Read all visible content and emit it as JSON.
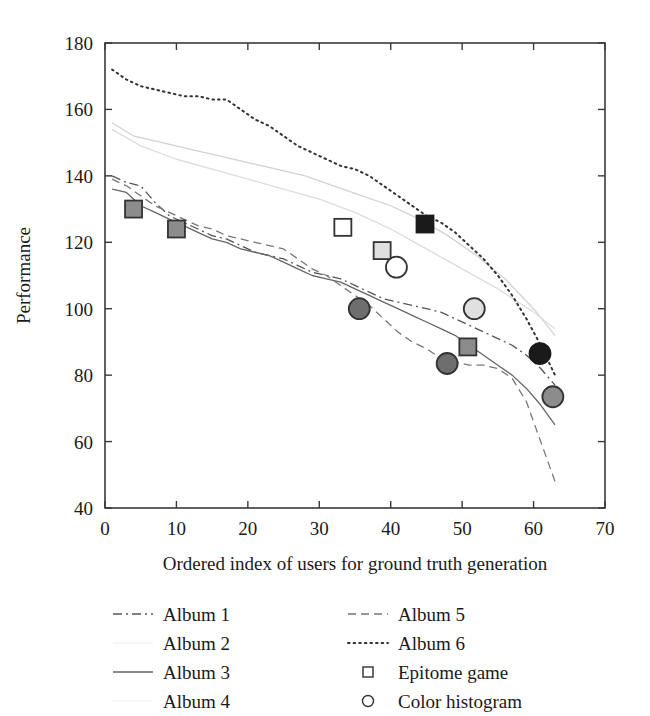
{
  "chart_data": {
    "type": "line",
    "title": "",
    "xlabel": "Ordered index of users for ground truth generation",
    "ylabel": "Performance",
    "xlim": [
      0,
      70
    ],
    "ylim": [
      40,
      180
    ],
    "xticks": [
      0,
      10,
      20,
      30,
      40,
      50,
      60,
      70
    ],
    "yticks": [
      40,
      60,
      80,
      100,
      120,
      140,
      160,
      180
    ],
    "grid": false,
    "legend_position": "below-axes",
    "series": [
      {
        "name": "Album 1",
        "style": "dash-dot",
        "color": "#555555",
        "x": [
          1,
          3,
          5,
          7,
          9,
          11,
          13,
          15,
          17,
          19,
          21,
          23,
          25,
          27,
          29,
          31,
          33,
          35,
          37,
          39,
          41,
          43,
          45,
          47,
          49,
          51,
          53,
          55,
          57,
          59,
          61,
          63
        ],
        "values": [
          140,
          138,
          137,
          132,
          128,
          126,
          124,
          122,
          121,
          119,
          117,
          116,
          115,
          113,
          111,
          110,
          109,
          107,
          105,
          103,
          102,
          101,
          100,
          99,
          97,
          95,
          93,
          91,
          89,
          86,
          82,
          77
        ]
      },
      {
        "name": "Album 2",
        "style": "solid-light",
        "color": "#d3d3d3",
        "x": [
          1,
          4,
          8,
          12,
          16,
          20,
          24,
          28,
          32,
          36,
          40,
          44,
          48,
          52,
          56,
          60,
          63
        ],
        "values": [
          156,
          152,
          150,
          148,
          146,
          144,
          142,
          140,
          137,
          134,
          131,
          127,
          122,
          116,
          109,
          100,
          92
        ]
      },
      {
        "name": "Album 3",
        "style": "solid",
        "color": "#666666",
        "x": [
          1,
          3,
          5,
          7,
          9,
          11,
          13,
          15,
          17,
          19,
          21,
          23,
          25,
          27,
          29,
          31,
          33,
          35,
          37,
          39,
          41,
          43,
          45,
          47,
          49,
          51,
          53,
          55,
          57,
          59,
          61,
          63
        ],
        "values": [
          136,
          135,
          131,
          129,
          127,
          125,
          123,
          121,
          120,
          118,
          117,
          116,
          114,
          112,
          110,
          109,
          108,
          106,
          104,
          102,
          100,
          98,
          96,
          94,
          92,
          89,
          86,
          83,
          80,
          76,
          71,
          65
        ]
      },
      {
        "name": "Album 4",
        "style": "solid-light",
        "color": "#dcdcdc",
        "x": [
          1,
          5,
          10,
          15,
          20,
          25,
          30,
          35,
          40,
          45,
          50,
          55,
          60,
          63
        ],
        "values": [
          154,
          149,
          145,
          142,
          139,
          136,
          133,
          129,
          124,
          118,
          112,
          106,
          99,
          94
        ]
      },
      {
        "name": "Album 5",
        "style": "dashed",
        "color": "#777777",
        "x": [
          1,
          3,
          5,
          7,
          9,
          11,
          13,
          15,
          17,
          19,
          21,
          23,
          25,
          27,
          29,
          31,
          33,
          35,
          37,
          39,
          41,
          43,
          45,
          47,
          49,
          51,
          53,
          55,
          57,
          59,
          61,
          63
        ],
        "values": [
          139,
          137,
          134,
          131,
          129,
          127,
          125,
          124,
          122,
          121,
          120,
          119,
          118,
          115,
          112,
          110,
          107,
          104,
          101,
          97,
          93,
          90,
          88,
          85,
          84,
          83,
          83,
          82,
          79,
          72,
          60,
          48
        ]
      },
      {
        "name": "Album 6",
        "style": "dotted",
        "color": "#333333",
        "x": [
          1,
          3,
          5,
          7,
          9,
          11,
          13,
          15,
          17,
          19,
          21,
          23,
          25,
          27,
          29,
          31,
          33,
          35,
          37,
          39,
          41,
          43,
          45,
          47,
          49,
          51,
          53,
          55,
          57,
          59,
          61,
          63
        ],
        "values": [
          172,
          169,
          167,
          166,
          165,
          164,
          164,
          163,
          163,
          160,
          157,
          155,
          152,
          149,
          147,
          145,
          143,
          142,
          140,
          137,
          134,
          131,
          128,
          126,
          123,
          119,
          115,
          110,
          104,
          97,
          89,
          80
        ]
      }
    ],
    "markers": [
      {
        "shape": "square",
        "x": 4,
        "y": 130,
        "fill": "#8c8c8c",
        "edge": "#333333",
        "group": "Epitome game"
      },
      {
        "shape": "square",
        "x": 10,
        "y": 124,
        "fill": "#8c8c8c",
        "edge": "#333333",
        "group": "Epitome game"
      },
      {
        "shape": "square",
        "x": 33.3,
        "y": 124.5,
        "fill": "#ffffff",
        "edge": "#333333",
        "group": "Epitome game"
      },
      {
        "shape": "square",
        "x": 38.8,
        "y": 117.5,
        "fill": "#e0e0e0",
        "edge": "#333333",
        "group": "Epitome game"
      },
      {
        "shape": "square",
        "x": 44.8,
        "y": 125.5,
        "fill": "#1a1a1a",
        "edge": "#1a1a1a",
        "group": "Epitome game"
      },
      {
        "shape": "square",
        "x": 50.8,
        "y": 88.5,
        "fill": "#8c8c8c",
        "edge": "#333333",
        "group": "Epitome game"
      },
      {
        "shape": "circle",
        "x": 40.8,
        "y": 112.5,
        "fill": "#ffffff",
        "edge": "#333333",
        "group": "Color histogram"
      },
      {
        "shape": "circle",
        "x": 35.6,
        "y": 100,
        "fill": "#6e6e6e",
        "edge": "#333333",
        "group": "Color histogram"
      },
      {
        "shape": "circle",
        "x": 51.7,
        "y": 100,
        "fill": "#e0e0e0",
        "edge": "#333333",
        "group": "Color histogram"
      },
      {
        "shape": "circle",
        "x": 47.9,
        "y": 83.5,
        "fill": "#6e6e6e",
        "edge": "#333333",
        "group": "Color histogram"
      },
      {
        "shape": "circle",
        "x": 60.9,
        "y": 86.5,
        "fill": "#1a1a1a",
        "edge": "#1a1a1a",
        "group": "Color histogram"
      },
      {
        "shape": "circle",
        "x": 62.7,
        "y": 73.5,
        "fill": "#8c8c8c",
        "edge": "#333333",
        "group": "Color histogram"
      }
    ]
  },
  "legend": {
    "column_left": [
      {
        "label": "Album 1",
        "style": "dash-dot",
        "color": "#555555"
      },
      {
        "label": "Album 2",
        "style": "solid-light",
        "color": "#f2f2f2"
      },
      {
        "label": "Album 3",
        "style": "solid",
        "color": "#666666"
      },
      {
        "label": "Album 4",
        "style": "solid-light",
        "color": "#f6f6f6"
      }
    ],
    "column_right": [
      {
        "label": "Album 5",
        "style": "dashed",
        "color": "#777777"
      },
      {
        "label": "Album 6",
        "style": "dotted",
        "color": "#333333"
      },
      {
        "label": "Epitome game",
        "style": "marker-square",
        "color": "#333333"
      },
      {
        "label": "Color histogram",
        "style": "marker-circle",
        "color": "#333333"
      }
    ]
  },
  "colors": {
    "axis": "#3a3a3a",
    "text": "#1a1a1a",
    "background": "#ffffff"
  }
}
